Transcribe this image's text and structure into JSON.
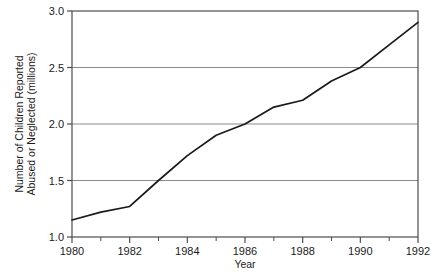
{
  "chart_data": {
    "type": "line",
    "title": "",
    "xlabel": "Year",
    "ylabel": "Number of Children Reported Abused or Neglected (millions)",
    "ylabel_lines": [
      "Number of Children Reported",
      "Abused or Neglected (millions)"
    ],
    "x": [
      1980,
      1981,
      1982,
      1983,
      1984,
      1985,
      1986,
      1987,
      1988,
      1989,
      1990,
      1991,
      1992
    ],
    "values": [
      1.15,
      1.22,
      1.27,
      1.5,
      1.72,
      1.9,
      2.0,
      2.15,
      2.21,
      2.38,
      2.5,
      2.7,
      2.9
    ],
    "series": [
      {
        "name": "Children reported abused or neglected",
        "values": [
          1.15,
          1.22,
          1.27,
          1.5,
          1.72,
          1.9,
          2.0,
          2.15,
          2.21,
          2.38,
          2.5,
          2.7,
          2.9
        ]
      }
    ],
    "xlim": [
      1980,
      1992
    ],
    "ylim": [
      1.0,
      3.0
    ],
    "x_tick_labels": [
      "1980",
      "1982",
      "1984",
      "1986",
      "1988",
      "1990",
      "1992"
    ],
    "x_tick_values": [
      1980,
      1982,
      1984,
      1986,
      1988,
      1990,
      1992
    ],
    "x_minor_tick_values": [
      1981,
      1983,
      1985,
      1987,
      1989,
      1991
    ],
    "y_tick_labels": [
      "1.0",
      "1.5",
      "2.0",
      "2.5",
      "3.0"
    ],
    "y_tick_values": [
      1.0,
      1.5,
      2.0,
      2.5,
      3.0
    ],
    "gridlines": {
      "horizontal": [
        1.5,
        2.0,
        2.5
      ],
      "vertical": []
    },
    "legend": {
      "entries": [],
      "position": "none"
    },
    "colors": {
      "line": "#1a1a1a",
      "grid": "#8a8a8a",
      "frame": "#4d4d4d",
      "background": "#ffffff",
      "text": "#1a1a1a"
    }
  }
}
